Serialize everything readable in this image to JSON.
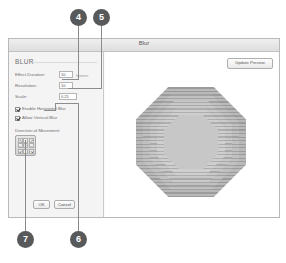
{
  "window": {
    "title": "Blur"
  },
  "panel": {
    "heading": "BLUR",
    "fields": [
      {
        "label": "Effect Duration:",
        "value": "10",
        "unit": "frames"
      },
      {
        "label": "Resolution:",
        "value": "10",
        "unit": ""
      },
      {
        "label": "Scale:",
        "value": "0.25",
        "unit": ""
      }
    ],
    "checkboxes": [
      {
        "label": "Enable Horizontal Blur",
        "checked": true
      },
      {
        "label": "Allow Vertical Blur",
        "checked": true
      }
    ],
    "direction": {
      "label": "Direction of Movement:",
      "cells": [
        "↖",
        "↑",
        "↗",
        "←",
        "•",
        "→",
        "↙",
        "↓",
        "↘"
      ]
    },
    "buttons": {
      "ok": "OK",
      "cancel": "Cancel"
    }
  },
  "preview": {
    "update_label": "Update Preview",
    "shape": "octagon-rings"
  },
  "callouts": [
    {
      "number": "4"
    },
    {
      "number": "5"
    },
    {
      "number": "6"
    },
    {
      "number": "7"
    }
  ],
  "colors": {
    "callout_bg": "#58595b",
    "leader": "#8a8c8e",
    "panel_bg": "#f4f4f4",
    "window_border": "#b9b9b9"
  }
}
